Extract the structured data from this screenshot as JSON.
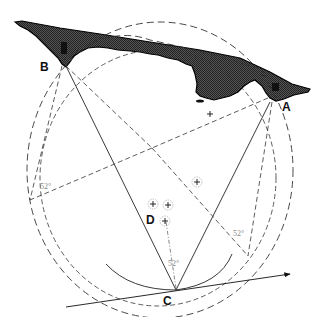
{
  "diagram": {
    "type": "geometric-construction",
    "points": [
      {
        "id": "A",
        "label": "A"
      },
      {
        "id": "B",
        "label": "B"
      },
      {
        "id": "C",
        "label": "C"
      },
      {
        "id": "D",
        "label": "D"
      }
    ],
    "angle_labels": [
      {
        "id": "angle-left",
        "text": "52°"
      },
      {
        "id": "angle-right",
        "text": "52°"
      },
      {
        "id": "angle-bottom",
        "text": "52°"
      }
    ],
    "position_markers_count": 4,
    "colors": {
      "land_fill": "#2a2a2a",
      "lines": "#222222",
      "angle_text": "#888888",
      "background": "#ffffff"
    }
  }
}
